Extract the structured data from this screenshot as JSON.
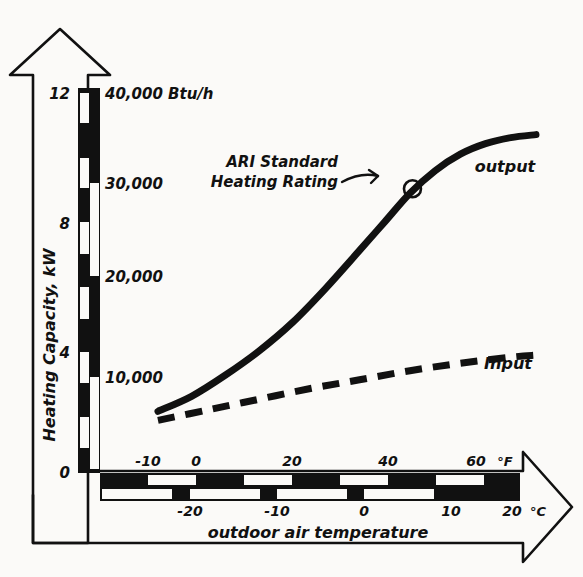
{
  "figure": {
    "kind": "hand-drawn-line-chart",
    "background_color": "#fbfaf8",
    "ink_color": "#111111"
  },
  "axes": {
    "y": {
      "title": "Heating Capacity, kW",
      "primary_unit": "kW",
      "secondary_unit": "Btu/h",
      "kw_ticks": [
        "0",
        "4",
        "8",
        "12"
      ],
      "btu_ticks": [
        "10,000",
        "20,000",
        "30,000",
        "40,000"
      ],
      "btu_unit_label": "40,000 Btu/h",
      "kw_range": [
        0,
        12.8
      ],
      "btu_range": [
        0,
        43500
      ],
      "arrow": "up-hollow-arrow-icon"
    },
    "x": {
      "title": "outdoor air temperature",
      "fahrenheit_unit": "°F",
      "celsius_unit": "°C",
      "fahrenheit_ticks": [
        "-10",
        "0",
        "20",
        "40",
        "60"
      ],
      "celsius_ticks": [
        "-20",
        "-10",
        "0",
        "10",
        "20"
      ],
      "fahrenheit_range": [
        -20,
        70
      ],
      "celsius_range": [
        -28.9,
        21.1
      ],
      "arrow": "right-hollow-arrow-icon"
    }
  },
  "series": [
    {
      "name": "output",
      "label": "output",
      "style": "solid-thick",
      "points_c": [
        {
          "t": -22.0,
          "kw": 2.05
        },
        {
          "t": -18.0,
          "kw": 2.55
        },
        {
          "t": -14.0,
          "kw": 3.25
        },
        {
          "t": -10.0,
          "kw": 4.05
        },
        {
          "t": -6.0,
          "kw": 5.0
        },
        {
          "t": -2.0,
          "kw": 6.15
        },
        {
          "t": 2.0,
          "kw": 7.4
        },
        {
          "t": 5.0,
          "kw": 8.35
        },
        {
          "t": 8.0,
          "kw": 9.3
        },
        {
          "t": 11.0,
          "kw": 10.05
        },
        {
          "t": 14.0,
          "kw": 10.6
        },
        {
          "t": 17.0,
          "kw": 10.95
        },
        {
          "t": 20.0,
          "kw": 11.15
        },
        {
          "t": 23.0,
          "kw": 11.25
        }
      ]
    },
    {
      "name": "input",
      "label": "Input",
      "style": "dashed-thick",
      "points_c": [
        {
          "t": -22.0,
          "kw": 1.75
        },
        {
          "t": -16.0,
          "kw": 2.1
        },
        {
          "t": -10.0,
          "kw": 2.45
        },
        {
          "t": -4.0,
          "kw": 2.8
        },
        {
          "t": 2.0,
          "kw": 3.1
        },
        {
          "t": 8.0,
          "kw": 3.4
        },
        {
          "t": 14.0,
          "kw": 3.65
        },
        {
          "t": 20.0,
          "kw": 3.85
        },
        {
          "t": 23.0,
          "kw": 3.92
        }
      ]
    }
  ],
  "annotations": [
    {
      "name": "ari-standard-heating-rating",
      "line1": "ARI Standard",
      "line2": "Heating Rating",
      "marker": "circled-point-marker",
      "marker_point_c": {
        "t": 8.3,
        "kw": 9.45
      }
    }
  ]
}
